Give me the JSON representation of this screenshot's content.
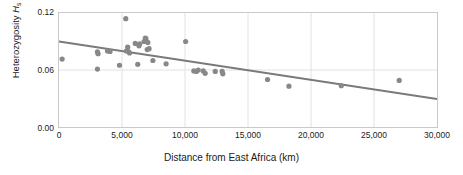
{
  "chart_data": {
    "type": "scatter",
    "title": "",
    "subtitle": "",
    "xlabel": "Distance from East Africa (km)",
    "ylabel_text": "Heterozygosity ",
    "ylabel_symbol": "H",
    "ylabel_subscript": "s",
    "xlim": [
      0,
      30000
    ],
    "ylim": [
      0.0,
      0.12
    ],
    "xticks": [
      0,
      5000,
      10000,
      15000,
      20000,
      25000,
      30000
    ],
    "xtick_labels": [
      "0",
      "5,000",
      "10,000",
      "15,000",
      "20,000",
      "25,000",
      "30,000"
    ],
    "yticks": [
      0.0,
      0.06,
      0.12
    ],
    "ytick_labels": [
      "0.00",
      "0.06",
      "0.12"
    ],
    "grid": "light gridlines at y=0.06 and at each x tick",
    "legend": "none",
    "marker_color": "#888888",
    "line_color": "#7a7a7a",
    "frame_color": "#c9c9c9",
    "grid_color": "#e2e2e2",
    "points": [
      {
        "x": 250,
        "y": 0.0715
      },
      {
        "x": 3050,
        "y": 0.061
      },
      {
        "x": 3050,
        "y": 0.079
      },
      {
        "x": 3100,
        "y": 0.0772
      },
      {
        "x": 3850,
        "y": 0.08
      },
      {
        "x": 4050,
        "y": 0.0795
      },
      {
        "x": 4800,
        "y": 0.065
      },
      {
        "x": 5300,
        "y": 0.114
      },
      {
        "x": 5350,
        "y": 0.08
      },
      {
        "x": 5450,
        "y": 0.084
      },
      {
        "x": 5500,
        "y": 0.0795
      },
      {
        "x": 5600,
        "y": 0.078
      },
      {
        "x": 6050,
        "y": 0.088
      },
      {
        "x": 6250,
        "y": 0.066
      },
      {
        "x": 6350,
        "y": 0.0855
      },
      {
        "x": 6400,
        "y": 0.0875
      },
      {
        "x": 6750,
        "y": 0.09
      },
      {
        "x": 6850,
        "y": 0.0935
      },
      {
        "x": 6900,
        "y": 0.093
      },
      {
        "x": 7000,
        "y": 0.0815
      },
      {
        "x": 7050,
        "y": 0.089
      },
      {
        "x": 7150,
        "y": 0.0825
      },
      {
        "x": 7450,
        "y": 0.07
      },
      {
        "x": 8500,
        "y": 0.0665
      },
      {
        "x": 10050,
        "y": 0.09
      },
      {
        "x": 10700,
        "y": 0.059
      },
      {
        "x": 10900,
        "y": 0.0585
      },
      {
        "x": 11050,
        "y": 0.06
      },
      {
        "x": 11450,
        "y": 0.059
      },
      {
        "x": 11600,
        "y": 0.0565
      },
      {
        "x": 12400,
        "y": 0.0585
      },
      {
        "x": 12950,
        "y": 0.0585
      },
      {
        "x": 13000,
        "y": 0.056
      },
      {
        "x": 16550,
        "y": 0.05
      },
      {
        "x": 18250,
        "y": 0.043
      },
      {
        "x": 22400,
        "y": 0.0435
      },
      {
        "x": 27000,
        "y": 0.049
      }
    ],
    "trendline": {
      "type": "linear-fit",
      "x_start": 0,
      "y_start": 0.09,
      "x_end": 30000,
      "y_end": 0.0295
    }
  }
}
